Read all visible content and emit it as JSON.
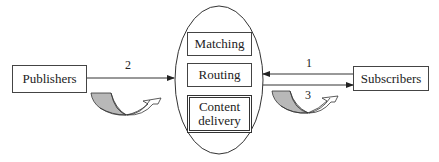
{
  "diagram": {
    "nodes": {
      "publishers": {
        "label": "Publishers"
      },
      "subscribers": {
        "label": "Subscribers"
      },
      "broker": {
        "components": [
          {
            "label": "Matching"
          },
          {
            "label": "Routing"
          },
          {
            "label": "Content delivery",
            "line1": "Content",
            "line2": "delivery"
          }
        ]
      }
    },
    "edges": [
      {
        "id": "1",
        "label": "1",
        "from": "Subscribers",
        "to": "Broker"
      },
      {
        "id": "2",
        "label": "2",
        "from": "Publishers",
        "to": "Broker"
      },
      {
        "id": "3",
        "label": "3",
        "from": "Broker",
        "to": "Subscribers"
      }
    ],
    "colors": {
      "stroke": "#333333",
      "curve_fill": "#b8b8b8",
      "background": "#ffffff"
    }
  }
}
